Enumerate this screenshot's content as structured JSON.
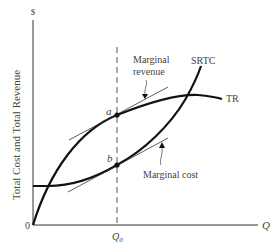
{
  "diagram": {
    "y_axis": {
      "symbol": "$",
      "label": "Total Cost and Total Revenue"
    },
    "x_axis": {
      "symbol": "Q",
      "origin": "0",
      "tick_label_base": "Q",
      "tick_label_sub": "0"
    },
    "curves": {
      "srtc": "SRTC",
      "tr": "TR"
    },
    "points": {
      "a": "a",
      "b": "b"
    },
    "annotations": {
      "marginal_revenue_line1": "Marginal",
      "marginal_revenue_line2": "revenue",
      "marginal_cost": "Marginal cost"
    },
    "colors": {
      "line": "#111111",
      "text": "#444444",
      "dashed": "#555555"
    }
  }
}
